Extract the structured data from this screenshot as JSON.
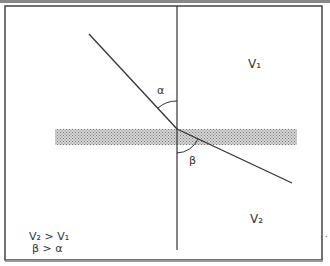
{
  "diagram": {
    "type": "refraction",
    "labels": {
      "upper_medium": "V₁",
      "lower_medium": "V₂",
      "incidence_angle": "α",
      "refraction_angle": "β"
    },
    "legend": {
      "line1": "V₂ > V₁",
      "line2": "β > α"
    },
    "colors": {
      "line": "#333333",
      "frame": "#444444",
      "band": "#9a9a9a"
    }
  }
}
